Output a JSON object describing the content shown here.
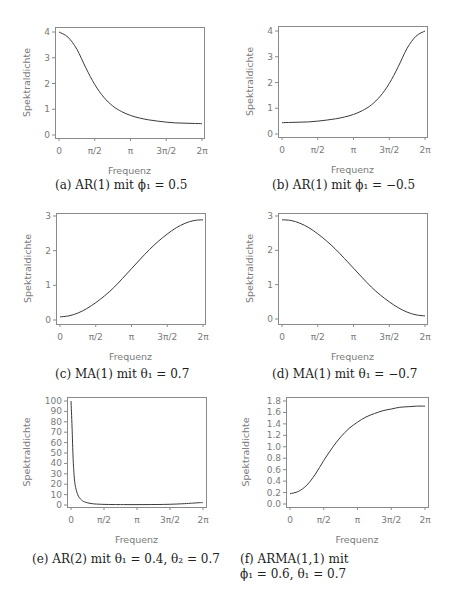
{
  "figure": {
    "panels": [
      {
        "id": "a",
        "caption": "(a) AR(1) mit ϕ₁ = 0.5",
        "caption_line2": ""
      },
      {
        "id": "b",
        "caption": "(b) AR(1) mit ϕ₁ = −0.5",
        "caption_line2": ""
      },
      {
        "id": "c",
        "caption": "(c) MA(1) mit θ₁ = 0.7",
        "caption_line2": ""
      },
      {
        "id": "d",
        "caption": "(d) MA(1) mit θ₁ = −0.7",
        "caption_line2": ""
      },
      {
        "id": "e",
        "caption": "(e) AR(2) mit θ₁ = 0.4,  θ₂ = 0.7",
        "caption_line2": ""
      },
      {
        "id": "f",
        "caption": "(f) ARMA(1,1) mit",
        "caption_line2": "ϕ₁ = 0.6,  θ₁ = 0.7"
      }
    ]
  },
  "chart_data": [
    {
      "type": "line",
      "title": "(a) AR(1) mit ϕ₁ = 0.5",
      "xlabel": "Frequenz",
      "ylabel": "Spektraldichte",
      "xticks": [
        "0",
        "π/2",
        "π",
        "3π/2",
        "2π"
      ],
      "yticks": [
        "0",
        "1",
        "2",
        "3",
        "4"
      ],
      "xlim": [
        0,
        6.2832
      ],
      "ylim": [
        0,
        4
      ],
      "grid": false,
      "x": [
        0,
        0.3927,
        0.7854,
        1.1781,
        1.5708,
        1.9635,
        2.3562,
        2.7489,
        3.1416,
        3.5343,
        3.927,
        4.3197,
        4.7124,
        5.1051,
        5.4978,
        5.8905,
        6.2832
      ],
      "values": [
        4.0,
        3.8,
        3.33,
        2.61,
        1.96,
        1.47,
        1.13,
        0.91,
        0.76,
        0.66,
        0.59,
        0.54,
        0.5,
        0.47,
        0.46,
        0.45,
        0.44
      ]
    },
    {
      "type": "line",
      "title": "(b) AR(1) mit ϕ₁ = −0.5",
      "xlabel": "Frequenz",
      "ylabel": "Spektraldichte",
      "xticks": [
        "0",
        "π/2",
        "π",
        "3π/2",
        "2π"
      ],
      "yticks": [
        "0",
        "1",
        "2",
        "3",
        "4"
      ],
      "xlim": [
        0,
        6.2832
      ],
      "ylim": [
        0,
        4
      ],
      "grid": false,
      "x": [
        0,
        0.3927,
        0.7854,
        1.1781,
        1.5708,
        1.9635,
        2.3562,
        2.7489,
        3.1416,
        3.5343,
        3.927,
        4.3197,
        4.7124,
        5.1051,
        5.4978,
        5.8905,
        6.2832
      ],
      "values": [
        0.44,
        0.45,
        0.46,
        0.47,
        0.5,
        0.54,
        0.59,
        0.66,
        0.76,
        0.91,
        1.13,
        1.47,
        1.96,
        2.61,
        3.33,
        3.8,
        4.0
      ]
    },
    {
      "type": "line",
      "title": "(c) MA(1) mit θ₁ = 0.7",
      "xlabel": "Frequenz",
      "ylabel": "Spektraldichte",
      "xticks": [
        "0",
        "π/2",
        "π",
        "3π/2",
        "2π"
      ],
      "yticks": [
        "0",
        "1",
        "2",
        "3"
      ],
      "xlim": [
        0,
        6.2832
      ],
      "ylim": [
        0,
        3
      ],
      "grid": false,
      "x": [
        0,
        0.3927,
        0.7854,
        1.1781,
        1.5708,
        1.9635,
        2.3562,
        2.7489,
        3.1416,
        3.5343,
        3.927,
        4.3197,
        4.7124,
        5.1051,
        5.4978,
        5.8905,
        6.2832
      ],
      "values": [
        0.09,
        0.12,
        0.2,
        0.33,
        0.5,
        0.7,
        0.93,
        1.2,
        1.48,
        1.76,
        2.03,
        2.27,
        2.48,
        2.66,
        2.79,
        2.87,
        2.89
      ]
    },
    {
      "type": "line",
      "title": "(d) MA(1) mit θ₁ = −0.7",
      "xlabel": "Frequenz",
      "ylabel": "Spektraldichte",
      "xticks": [
        "0",
        "π/2",
        "π",
        "3π/2",
        "2π"
      ],
      "yticks": [
        "0",
        "1",
        "2",
        "3"
      ],
      "xlim": [
        0,
        6.2832
      ],
      "ylim": [
        0,
        3
      ],
      "grid": false,
      "x": [
        0,
        0.3927,
        0.7854,
        1.1781,
        1.5708,
        1.9635,
        2.3562,
        2.7489,
        3.1416,
        3.5343,
        3.927,
        4.3197,
        4.7124,
        5.1051,
        5.4978,
        5.8905,
        6.2832
      ],
      "values": [
        2.89,
        2.87,
        2.79,
        2.66,
        2.48,
        2.27,
        2.03,
        1.76,
        1.48,
        1.2,
        0.93,
        0.7,
        0.5,
        0.33,
        0.2,
        0.12,
        0.09
      ]
    },
    {
      "type": "line",
      "title": "(e) AR(2) mit θ₁ = 0.4, θ₂ = 0.7",
      "xlabel": "Frequenz",
      "ylabel": "Spektraldichte",
      "xticks": [
        "0",
        "π/2",
        "π",
        "3π/2",
        "2π"
      ],
      "yticks": [
        "0",
        "10",
        "20",
        "30",
        "40",
        "50",
        "60",
        "70",
        "80",
        "90",
        "100"
      ],
      "xlim": [
        0,
        6.2832
      ],
      "ylim": [
        0,
        100
      ],
      "grid": false,
      "x": [
        0,
        0.05,
        0.1,
        0.15,
        0.2,
        0.3,
        0.4,
        0.5,
        0.6,
        0.8,
        1.0,
        1.2,
        1.5708,
        2.0,
        2.5,
        3.1416,
        3.8,
        4.4,
        5.0,
        5.5,
        5.8,
        6.1,
        6.2832
      ],
      "values": [
        100,
        75,
        45,
        28,
        19,
        11,
        7,
        4.8,
        3.4,
        2.0,
        1.3,
        0.9,
        0.6,
        0.45,
        0.4,
        0.38,
        0.42,
        0.55,
        0.9,
        1.4,
        1.8,
        2.2,
        2.3
      ]
    },
    {
      "type": "line",
      "title": "(f) ARMA(1,1) mit ϕ₁ = 0.6, θ₁ = 0.7",
      "xlabel": "Frequenz",
      "ylabel": "Spektraldichte",
      "xticks": [
        "0",
        "π/2",
        "π",
        "3π/2",
        "2π"
      ],
      "yticks": [
        "0.0",
        "0.2",
        "0.4",
        "0.6",
        "0.8",
        "1.0",
        "1.2",
        "1.4",
        "1.6",
        "1.8"
      ],
      "xlim": [
        0,
        6.2832
      ],
      "ylim": [
        0,
        1.8
      ],
      "grid": false,
      "x": [
        0,
        0.3927,
        0.7854,
        1.1781,
        1.5708,
        1.9635,
        2.3562,
        2.7489,
        3.1416,
        3.5343,
        3.927,
        4.3197,
        4.7124,
        5.1051,
        5.4978,
        5.8905,
        6.2832
      ],
      "values": [
        0.18,
        0.22,
        0.33,
        0.52,
        0.76,
        0.98,
        1.17,
        1.32,
        1.43,
        1.52,
        1.58,
        1.63,
        1.66,
        1.69,
        1.7,
        1.71,
        1.71
      ]
    }
  ]
}
